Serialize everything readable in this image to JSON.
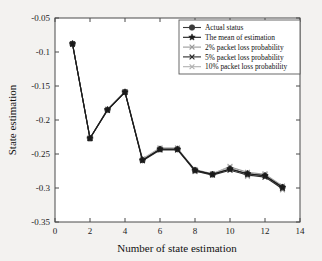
{
  "chart_data": {
    "type": "line",
    "title": "",
    "xlabel": "Number of state estimation",
    "ylabel": "State estimation",
    "xlim": [
      0,
      14
    ],
    "ylim": [
      -0.35,
      -0.05
    ],
    "xticks": [
      0,
      2,
      4,
      6,
      8,
      10,
      12,
      14
    ],
    "xtick_labels": [
      "0",
      "2",
      "4",
      "6",
      "8",
      "10",
      "12",
      "14"
    ],
    "yticks": [
      -0.05,
      -0.1,
      -0.15,
      -0.2,
      -0.25,
      -0.3,
      -0.35
    ],
    "ytick_labels": [
      "-0.05",
      "-0.1",
      "-0.15",
      "-0.2",
      "-0.25",
      "-0.3",
      "-0.35"
    ],
    "grid": false,
    "legend_position": "upper right",
    "x": [
      1,
      2,
      3,
      4,
      5,
      6,
      7,
      8,
      9,
      10,
      11,
      12,
      13
    ],
    "series": [
      {
        "name": "Actual status",
        "marker": "circle",
        "color": "#3a3a3a",
        "values": [
          -0.088,
          -0.227,
          -0.185,
          -0.159,
          -0.259,
          -0.243,
          -0.243,
          -0.274,
          -0.28,
          -0.272,
          -0.279,
          -0.282,
          -0.299
        ]
      },
      {
        "name": "The mean of estimation",
        "marker": "star",
        "color": "#1a1a1a",
        "values": [
          -0.088,
          -0.227,
          -0.185,
          -0.159,
          -0.259,
          -0.243,
          -0.243,
          -0.274,
          -0.28,
          -0.272,
          -0.279,
          -0.282,
          -0.299
        ]
      },
      {
        "name": "2% packet loss  probability",
        "marker": "x",
        "color": "#9a9a9a",
        "values": [
          -0.088,
          -0.227,
          -0.185,
          -0.159,
          -0.258,
          -0.242,
          -0.242,
          -0.273,
          -0.279,
          -0.269,
          -0.277,
          -0.28,
          -0.297
        ]
      },
      {
        "name": "5% packet loss  probability",
        "marker": "x",
        "color": "#2b2b2b",
        "values": [
          -0.088,
          -0.227,
          -0.186,
          -0.159,
          -0.26,
          -0.244,
          -0.244,
          -0.275,
          -0.281,
          -0.274,
          -0.281,
          -0.284,
          -0.301
        ]
      },
      {
        "name": "10% packet loss  probability",
        "marker": "x",
        "color": "#b0b0b0",
        "values": [
          -0.088,
          -0.227,
          -0.184,
          -0.158,
          -0.257,
          -0.241,
          -0.241,
          -0.276,
          -0.279,
          -0.268,
          -0.283,
          -0.279,
          -0.303
        ]
      }
    ]
  },
  "legend": {
    "items": [
      {
        "label": "Actual status"
      },
      {
        "label": "The mean of estimation"
      },
      {
        "label": "2% packet loss  probability"
      },
      {
        "label": "5% packet loss  probability"
      },
      {
        "label": "10% packet loss  probability"
      }
    ]
  }
}
